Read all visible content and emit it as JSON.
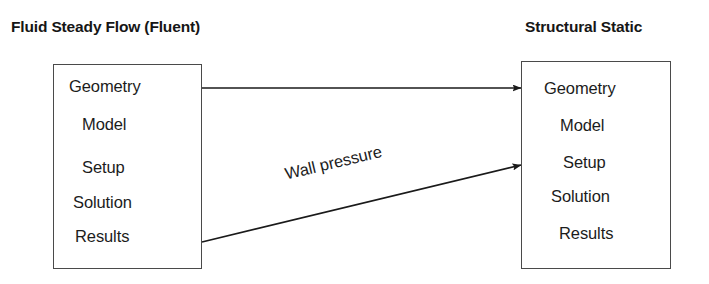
{
  "diagram": {
    "type": "workflow-coupling-diagram",
    "background_color": "#ffffff",
    "line_color": "#1a1a1a",
    "box_border_color": "#4a4a4a",
    "panels": [
      {
        "id": "fluid",
        "title": "Fluid Steady Flow (Fluent)",
        "steps": [
          "Geometry",
          "Model",
          "Setup",
          "Solution",
          "Results"
        ]
      },
      {
        "id": "structural",
        "title": "Structural Static",
        "steps": [
          "Geometry",
          "Model",
          "Setup",
          "Solution",
          "Results"
        ]
      }
    ],
    "connections": [
      {
        "id": "geometry-link",
        "label": "",
        "from": "fluid.Geometry",
        "to": "structural.Geometry",
        "style": "straight-arrow"
      },
      {
        "id": "wall-pressure-link",
        "label": "Wall pressure",
        "from": "fluid.Results",
        "to": "structural.Setup",
        "style": "diagonal-arrow"
      }
    ]
  }
}
